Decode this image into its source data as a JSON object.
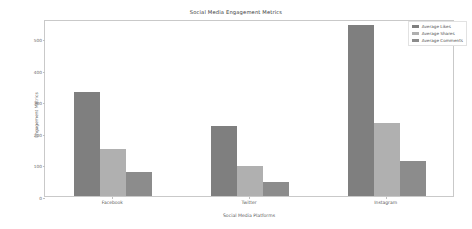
{
  "chart_data": {
    "type": "bar",
    "title": "Social Media Engagement Metrics",
    "xlabel": "Social Media Platforms",
    "ylabel": "Engagement Metrics",
    "categories": [
      "Facebook",
      "Twitter",
      "Instagram"
    ],
    "series": [
      {
        "name": "Average Likes",
        "values": [
          330,
          220,
          540
        ],
        "color": "#7f7f7f"
      },
      {
        "name": "Average Shares",
        "values": [
          150,
          95,
          230
        ],
        "color": "#b0b0b0"
      },
      {
        "name": "Average Comments",
        "values": [
          75,
          45,
          110
        ],
        "color": "#8c8c8c"
      }
    ],
    "ylim": [
      0,
      560
    ],
    "yticks": [
      0,
      100,
      200,
      300,
      400,
      500
    ],
    "ytick_labels": [
      "0",
      "100",
      "200",
      "300",
      "400",
      "500"
    ],
    "grid": false,
    "legend_position": "upper right",
    "legend_entries": [
      "Average Likes",
      "Average Shares",
      "Average Comments"
    ]
  }
}
